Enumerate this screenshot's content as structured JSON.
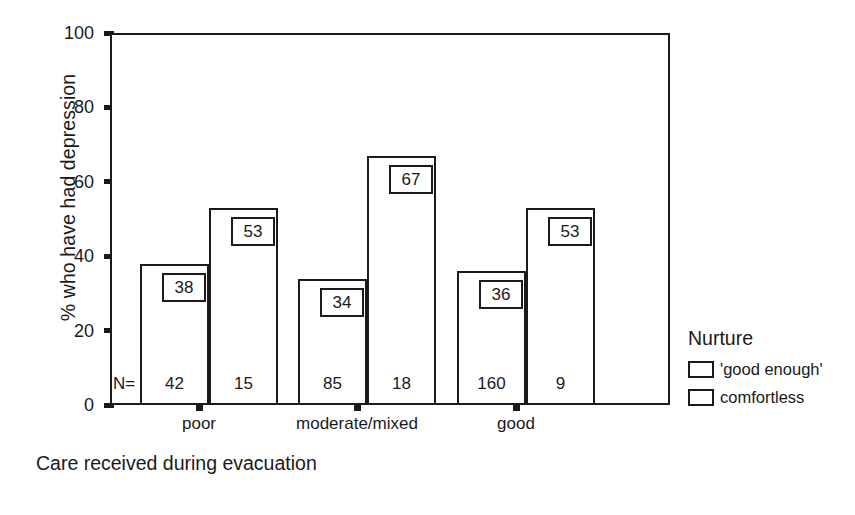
{
  "chart_data": {
    "type": "bar",
    "title": "",
    "xlabel": "Care received during evacuation",
    "ylabel": "% who have had depression",
    "ylim": [
      0,
      100
    ],
    "yticks": [
      0,
      20,
      40,
      60,
      80,
      100
    ],
    "ytick_labels": [
      "0",
      "20",
      "40",
      "60",
      "80",
      "100"
    ],
    "grid": false,
    "legend_position": "right",
    "legend_title": "Nurture",
    "n_prefix": "N=",
    "categories": [
      "poor",
      "moderate/mixed",
      "good"
    ],
    "series": [
      {
        "name": "'good enough'",
        "values": [
          38,
          34,
          36
        ],
        "n": [
          42,
          85,
          160
        ]
      },
      {
        "name": "comfortless",
        "values": [
          53,
          67,
          53
        ],
        "n": [
          15,
          18,
          9
        ]
      }
    ],
    "bars": [
      {
        "group": "poor",
        "series": "'good enough'",
        "value": 38,
        "label": "38",
        "n": "42",
        "left": 140,
        "width": 69
      },
      {
        "group": "poor",
        "series": "comfortless",
        "value": 53,
        "label": "53",
        "n": "15",
        "left": 209,
        "width": 69
      },
      {
        "group": "moderate/mixed",
        "series": "'good enough'",
        "value": 34,
        "label": "34",
        "n": "85",
        "left": 298,
        "width": 69
      },
      {
        "group": "moderate/mixed",
        "series": "comfortless",
        "value": 67,
        "label": "67",
        "n": "18",
        "left": 367,
        "width": 69
      },
      {
        "group": "good",
        "series": "'good enough'",
        "value": 36,
        "label": "36",
        "n": "160",
        "left": 457,
        "width": 69
      },
      {
        "group": "good",
        "series": "comfortless",
        "value": 53,
        "label": "53",
        "n": "9",
        "left": 526,
        "width": 69
      }
    ],
    "xtick_positions": [
      199,
      357,
      516
    ]
  },
  "colors": {
    "ink": "#1a1a1a",
    "bar_fill": "#ffffff",
    "background": "#ffffff"
  }
}
